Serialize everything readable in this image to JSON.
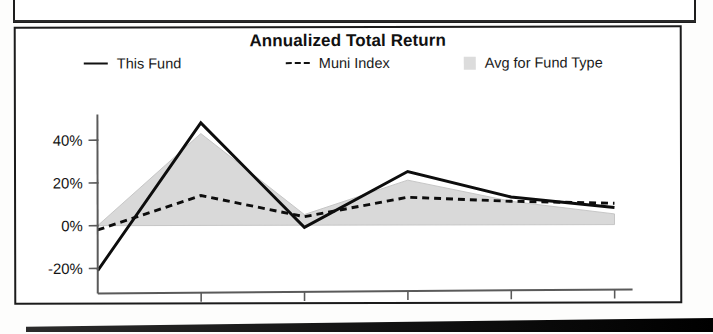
{
  "chart": {
    "title": "Annualized Total Return",
    "ytd_label": "YTD"
  },
  "legend": {
    "items": [
      {
        "label": "This Fund",
        "marker": "solid-line-swatch",
        "color": "#0d0d0d"
      },
      {
        "label": "Muni Index",
        "marker": "dashed-line-swatch",
        "color": "#0d0d0d"
      },
      {
        "label": "Avg for Fund Type",
        "marker": "gray-square-swatch",
        "color": "#d9d9d9"
      }
    ]
  },
  "chart_data": {
    "type": "line",
    "title": "Annualized Total Return",
    "xlabel": "",
    "ylabel": "",
    "categories": [
      "2007",
      "2008",
      "2009",
      "2010",
      "2011",
      "2012"
    ],
    "x_tick_labels": [
      "2007",
      "2008",
      "2009",
      "2010",
      "2011",
      "2012"
    ],
    "x_axis_note": "YTD",
    "y_tick_labels": [
      "40%",
      "20%",
      "0%",
      "-20%"
    ],
    "y_ticks": [
      40,
      20,
      0,
      -20
    ],
    "ylim": [
      -28,
      52
    ],
    "grid": false,
    "legend_position": "top",
    "series": [
      {
        "name": "This Fund",
        "style": "solid",
        "color": "#0d0d0d",
        "values": [
          -21,
          48,
          -1,
          25,
          13,
          8
        ]
      },
      {
        "name": "Muni Index",
        "style": "dashed",
        "color": "#0d0d0d",
        "values": [
          -2,
          14,
          4,
          13,
          11,
          10
        ]
      },
      {
        "name": "Avg for Fund Type",
        "style": "filled-area",
        "color": "#d9d9d9",
        "values": [
          0,
          43,
          5,
          21,
          11,
          5
        ]
      }
    ]
  }
}
